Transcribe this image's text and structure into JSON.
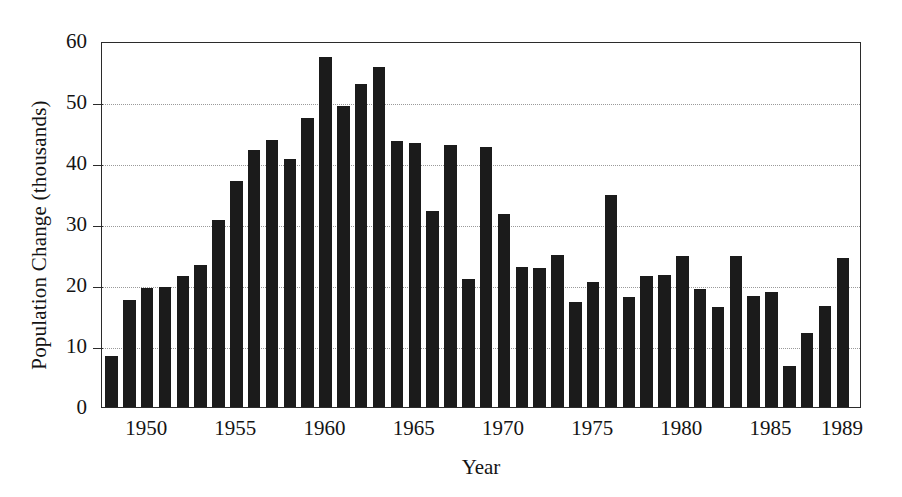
{
  "chart_data": {
    "type": "bar",
    "title": "",
    "xlabel": "Year",
    "ylabel": "Population Change (thousands)",
    "ylim": [
      0,
      60
    ],
    "yticks": [
      0,
      10,
      20,
      30,
      40,
      50,
      60
    ],
    "xtick_labels": [
      "1950",
      "1955",
      "1960",
      "1965",
      "1970",
      "1975",
      "1980",
      "1985",
      "1989"
    ],
    "xtick_years": [
      1950,
      1955,
      1960,
      1965,
      1970,
      1975,
      1980,
      1985,
      1989
    ],
    "grid": "horizontal-dotted",
    "legend": "none",
    "bar_color": "#1b1b1b",
    "categories": [
      1948,
      1949,
      1950,
      1951,
      1952,
      1953,
      1954,
      1955,
      1956,
      1957,
      1958,
      1959,
      1960,
      1961,
      1962,
      1963,
      1964,
      1965,
      1966,
      1967,
      1968,
      1969,
      1970,
      1971,
      1972,
      1973,
      1974,
      1975,
      1976,
      1977,
      1978,
      1979,
      1980,
      1981,
      1982,
      1983,
      1984,
      1985,
      1986,
      1987,
      1988,
      1989
    ],
    "values": [
      8.3,
      17.5,
      19.5,
      19.6,
      21.5,
      23.3,
      30.6,
      37.0,
      42.1,
      43.8,
      40.7,
      47.4,
      57.4,
      49.4,
      53.0,
      55.7,
      43.6,
      43.3,
      32.2,
      42.9,
      21.0,
      42.7,
      31.6,
      23.0,
      22.8,
      24.9,
      17.2,
      20.5,
      34.8,
      18.0,
      21.5,
      21.7,
      24.7,
      19.4,
      16.4,
      24.8,
      18.2,
      18.9,
      6.7,
      12.2,
      16.5,
      24.5
    ]
  }
}
